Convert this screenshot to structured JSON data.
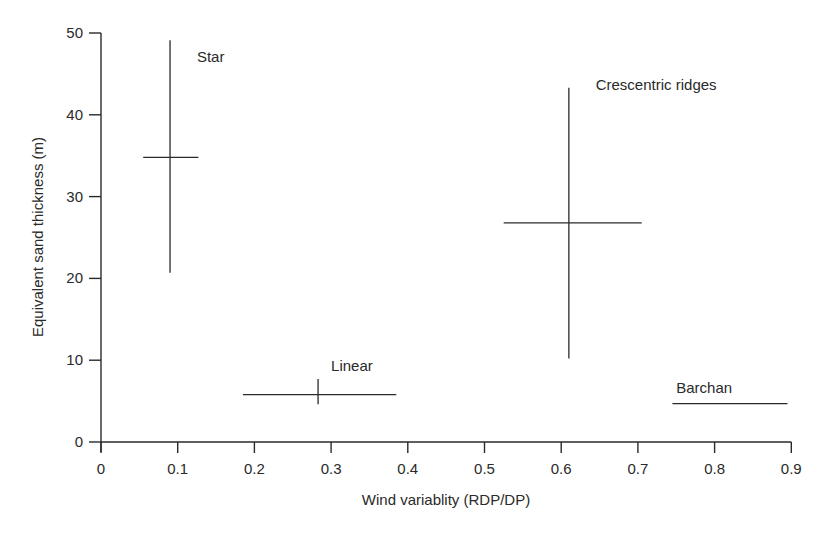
{
  "chart_data": {
    "type": "scatter",
    "title": "",
    "xlabel": "Wind variablity (RDP/DP)",
    "ylabel": "Equivalent sand thickness (m)",
    "xlim": [
      0,
      0.9
    ],
    "ylim": [
      0,
      50
    ],
    "x_ticks": [
      "0",
      "0.1",
      "0.2",
      "0.3",
      "0.4",
      "0.5",
      "0.6",
      "0.7",
      "0.8",
      "0.9"
    ],
    "y_ticks": [
      "0",
      "10",
      "20",
      "30",
      "40",
      "50"
    ],
    "grid": false,
    "legend": null,
    "series": [
      {
        "name": "Star",
        "x": 0.09,
        "y": 34.8,
        "x_range": [
          0.055,
          0.127
        ],
        "y_range": [
          20.7,
          49.1
        ]
      },
      {
        "name": "Crescentric ridges",
        "x": 0.61,
        "y": 26.8,
        "x_range": [
          0.525,
          0.705
        ],
        "y_range": [
          10.2,
          43.3
        ]
      },
      {
        "name": "Linear",
        "x": 0.283,
        "y": 5.8,
        "x_range": [
          0.185,
          0.385
        ],
        "y_range": [
          4.6,
          7.7
        ]
      },
      {
        "name": "Barchan",
        "x": 0.82,
        "y": 4.7,
        "x_range": [
          0.745,
          0.895
        ],
        "y_range": null
      }
    ],
    "annotations": [
      {
        "text": "Star",
        "x": 0.125,
        "y": 46.5
      },
      {
        "text": "Crescentric ridges",
        "x": 0.645,
        "y": 43.0
      },
      {
        "text": "Linear",
        "x": 0.3,
        "y": 8.7
      },
      {
        "text": "Barchan",
        "x": 0.75,
        "y": 6.0
      }
    ]
  }
}
